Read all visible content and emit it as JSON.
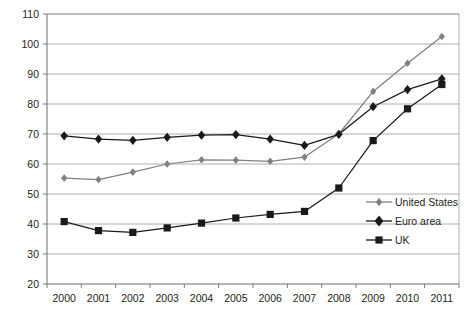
{
  "chart_data": {
    "type": "line",
    "title": "",
    "xlabel": "",
    "ylabel": "",
    "grid": true,
    "legend_position": "inside-right",
    "categories": [
      "2000",
      "2001",
      "2002",
      "2003",
      "2004",
      "2005",
      "2006",
      "2007",
      "2008",
      "2009",
      "2010",
      "2011"
    ],
    "ylim": [
      20,
      110
    ],
    "ytick_step": 10,
    "yticks": [
      "20",
      "30",
      "40",
      "50",
      "60",
      "70",
      "80",
      "90",
      "100",
      "110"
    ],
    "series": [
      {
        "name": "United States",
        "color": "#808080",
        "marker": "diamond",
        "values": [
          55.3,
          54.8,
          57.3,
          60.0,
          61.4,
          61.3,
          60.9,
          62.3,
          70.0,
          84.2,
          93.6,
          102.5
        ]
      },
      {
        "name": "Euro area",
        "color": "#1a1a1a",
        "marker": "diamond",
        "values": [
          69.4,
          68.3,
          67.9,
          68.9,
          69.6,
          69.8,
          68.3,
          66.2,
          69.9,
          79.1,
          84.8,
          88.4
        ]
      },
      {
        "name": "UK",
        "color": "#1a1a1a",
        "marker": "square",
        "values": [
          40.8,
          37.8,
          37.2,
          38.7,
          40.3,
          42.0,
          43.2,
          44.2,
          52.0,
          67.8,
          78.4,
          86.5
        ]
      }
    ]
  },
  "legend": {
    "items": [
      {
        "label": "United States"
      },
      {
        "label": "Euro area"
      },
      {
        "label": "UK"
      }
    ]
  },
  "axes": {
    "frame_color": "#6e6e6e",
    "grid_color": "#9a9a9a"
  }
}
